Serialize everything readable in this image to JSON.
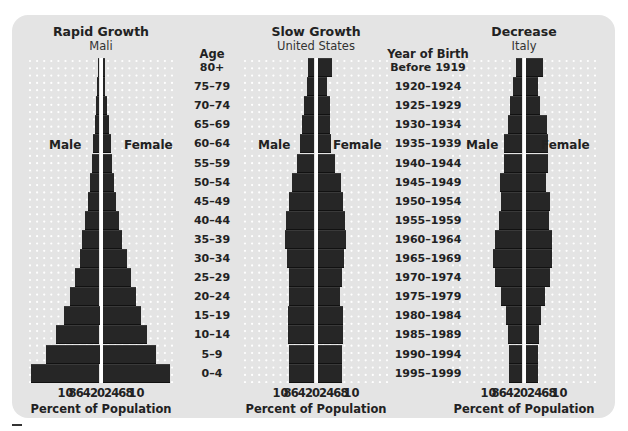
{
  "age_header": "Age",
  "year_header": "Year of Birth",
  "age_groups": [
    "80+",
    "75–79",
    "70–74",
    "65–69",
    "60–64",
    "55–59",
    "50–54",
    "45–49",
    "40–44",
    "35–39",
    "30–34",
    "25–29",
    "20–24",
    "15–19",
    "10–14",
    "5–9",
    "0–4"
  ],
  "birth_years": [
    "Before 1919",
    "1920–1924",
    "1925–1929",
    "1930–1934",
    "1935–1939",
    "1940–1944",
    "1945–1949",
    "1950–1954",
    "1955–1959",
    "1960–1964",
    "1965–1969",
    "1970–1974",
    "1975–1979",
    "1980–1984",
    "1985–1989",
    "1990–1994",
    "1995–1999"
  ],
  "colors": {
    "panel_bg": "#e4e4e4",
    "bar": "#262626",
    "center_line": "#ffffff",
    "grid_dot": "#ffffff"
  },
  "chart_data": [
    {
      "type": "bar",
      "orientation": "horizontal-population-pyramid",
      "title": "Rapid Growth",
      "subtitle": "Mali",
      "xlabel": "Percent of Population",
      "male_label": "Male",
      "female_label": "Female",
      "xlim": [
        -10,
        10
      ],
      "tick_labels": [
        "10",
        "8",
        "6",
        "4",
        "2",
        "0",
        "2",
        "4",
        "6",
        "8",
        "10"
      ],
      "categories": [
        "80+",
        "75–79",
        "70–74",
        "65–69",
        "60–64",
        "55–59",
        "50–54",
        "45–49",
        "40–44",
        "35–39",
        "30–34",
        "25–29",
        "20–24",
        "15–19",
        "10–14",
        "5–9",
        "0–4"
      ],
      "series": [
        {
          "name": "Male",
          "values": [
            0.2,
            0.3,
            0.5,
            0.7,
            0.9,
            1.1,
            1.3,
            1.6,
            2.0,
            2.4,
            2.8,
            3.4,
            4.2,
            5.0,
            6.1,
            7.5,
            9.6
          ]
        },
        {
          "name": "Female",
          "values": [
            0.3,
            0.4,
            0.6,
            0.9,
            1.2,
            1.4,
            1.6,
            1.9,
            2.3,
            2.8,
            3.4,
            4.0,
            4.7,
            5.4,
            6.3,
            7.6,
            9.5
          ]
        }
      ],
      "grid": "dotted"
    },
    {
      "type": "bar",
      "orientation": "horizontal-population-pyramid",
      "title": "Slow Growth",
      "subtitle": "United States",
      "xlabel": "Percent of Population",
      "male_label": "Male",
      "female_label": "Female",
      "xlim": [
        -10,
        10
      ],
      "tick_labels": [
        "10",
        "8",
        "6",
        "4",
        "2",
        "0",
        "2",
        "4",
        "6",
        "8",
        "10"
      ],
      "categories": [
        "80+",
        "75–79",
        "70–74",
        "65–69",
        "60–64",
        "55–59",
        "50–54",
        "45–49",
        "40–44",
        "35–39",
        "30–34",
        "25–29",
        "20–24",
        "15–19",
        "10–14",
        "5–9",
        "0–4"
      ],
      "series": [
        {
          "name": "Male",
          "values": [
            0.9,
            1.0,
            1.5,
            1.7,
            2.0,
            2.4,
            3.2,
            3.6,
            4.0,
            4.1,
            3.9,
            3.6,
            3.6,
            3.8,
            3.7,
            3.6,
            3.6
          ]
        },
        {
          "name": "Female",
          "values": [
            2.0,
            1.4,
            1.7,
            1.8,
            1.9,
            2.4,
            3.3,
            3.6,
            3.9,
            4.0,
            3.7,
            3.4,
            3.2,
            3.6,
            3.6,
            3.5,
            3.4
          ]
        }
      ],
      "grid": "dotted"
    },
    {
      "type": "bar",
      "orientation": "horizontal-population-pyramid",
      "title": "Decrease",
      "subtitle": "Italy",
      "xlabel": "Percent of Population",
      "male_label": "Male",
      "female_label": "Female",
      "xlim": [
        -10,
        10
      ],
      "tick_labels": [
        "10",
        "8",
        "6",
        "4",
        "2",
        "0",
        "2",
        "4",
        "6",
        "8",
        "10"
      ],
      "categories": [
        "Before 1919",
        "1920–1924",
        "1925–1929",
        "1930–1934",
        "1935–1939",
        "1940–1944",
        "1945–1949",
        "1950–1954",
        "1955–1959",
        "1960–1964",
        "1965–1969",
        "1970–1974",
        "1975–1979",
        "1980–1984",
        "1985–1989",
        "1990–1994",
        "1995–1999"
      ],
      "series": [
        {
          "name": "Male",
          "values": [
            0.9,
            1.4,
            1.8,
            2.1,
            2.6,
            2.6,
            3.1,
            3.0,
            3.3,
            3.9,
            4.2,
            3.9,
            3.0,
            2.3,
            2.0,
            1.9,
            1.9
          ]
        },
        {
          "name": "Female",
          "values": [
            2.4,
            1.7,
            2.0,
            3.0,
            3.2,
            3.1,
            2.9,
            3.5,
            3.3,
            3.7,
            3.7,
            3.5,
            2.8,
            2.2,
            1.9,
            1.8,
            1.7
          ]
        }
      ],
      "grid": "dotted"
    }
  ]
}
